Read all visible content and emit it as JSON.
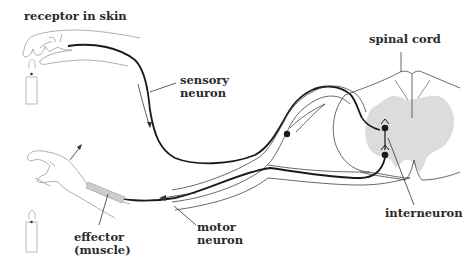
{
  "labels": {
    "receptor": "receptor in skin",
    "sensory_1": "sensory",
    "sensory_2": "neuron",
    "spinal_cord": "spinal cord",
    "interneuron": "interneuron",
    "motor_1": "motor",
    "motor_2": "neuron",
    "effector_1": "effector",
    "effector_2": "(muscle)"
  },
  "colors": {
    "line": "#1a1a1a",
    "outline": "#555555",
    "grey_matter": "#dcdcdc",
    "skin": "#9a9a9a"
  }
}
